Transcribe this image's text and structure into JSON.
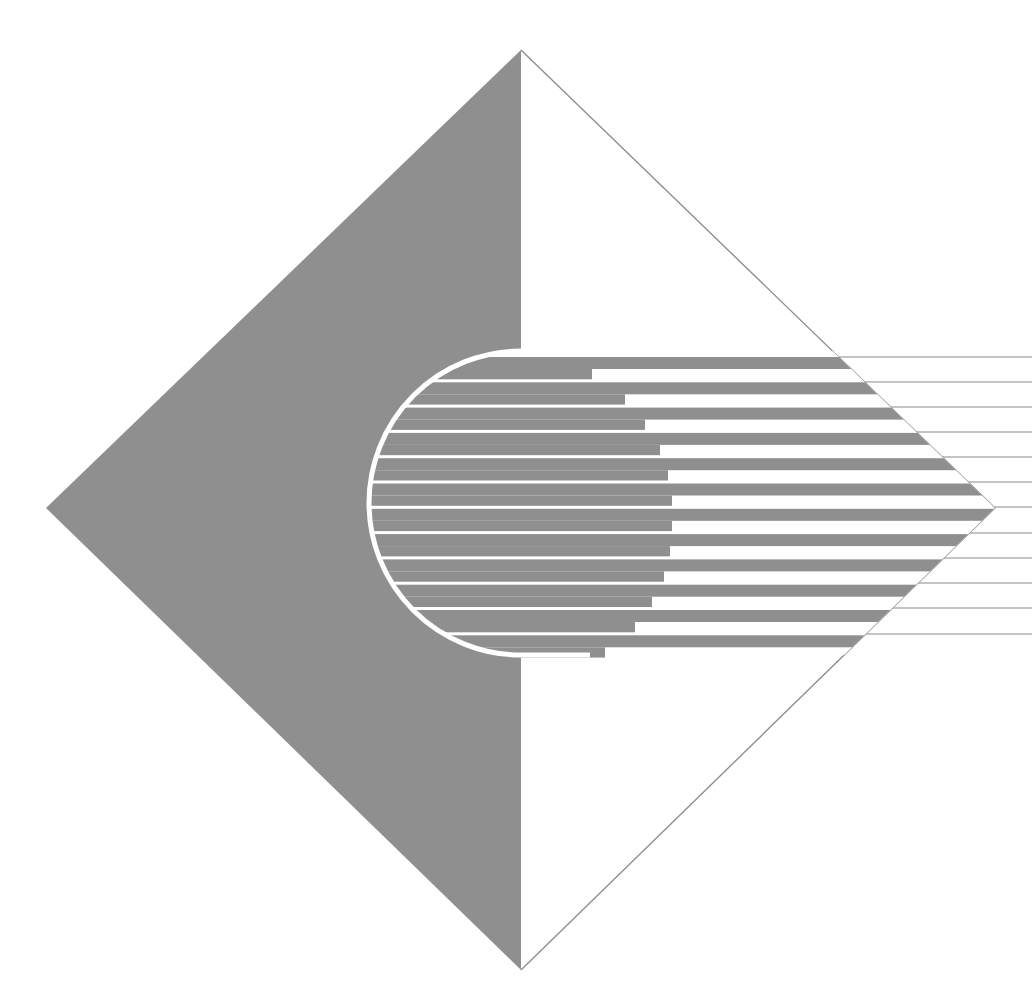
{
  "artwork": {
    "title": "Abstract diamond emblem with striped semicircle",
    "colors": {
      "background": "#ffffff",
      "gray": "#8f8f8f",
      "outline": "#8f8f8f",
      "line": "#8a8a8a"
    },
    "diamond": {
      "top": [
        521,
        50
      ],
      "right": [
        995,
        508
      ],
      "bottom": [
        521,
        970
      ],
      "left": [
        46,
        508
      ]
    },
    "pill": {
      "center": [
        521,
        503
      ],
      "radius": 152,
      "outline_width": 5
    },
    "stripes": {
      "count": 12,
      "start_y": 357,
      "pitch": 25.3,
      "band_height": 12,
      "separator_height": 3,
      "step_x": [
        592,
        625,
        645,
        660,
        668,
        672,
        672,
        670,
        664,
        652,
        635,
        605
      ]
    },
    "lines": {
      "count": 12,
      "y": [
        357,
        382,
        407,
        432,
        457,
        482,
        507,
        533,
        558,
        583,
        608,
        634
      ],
      "end_x": 1032
    }
  }
}
